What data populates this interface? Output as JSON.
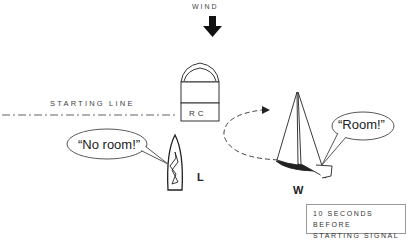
{
  "diagram": {
    "type": "sailing-race-start-illustration",
    "wind": {
      "label": "WIND",
      "direction": "down"
    },
    "starting_line": {
      "label": "STARTING LINE"
    },
    "committee_boat": {
      "label": "RC"
    },
    "boats": [
      {
        "id": "L",
        "label": "L",
        "speech": "“No room!”"
      },
      {
        "id": "W",
        "label": "W",
        "speech": "“Room!”"
      }
    ],
    "caption": {
      "line1": "10 SECONDS BEFORE",
      "line2": "STARTING SIGNAL"
    },
    "colors": {
      "ink": "#222222",
      "light_ink": "#777777",
      "background": "#ffffff"
    }
  }
}
